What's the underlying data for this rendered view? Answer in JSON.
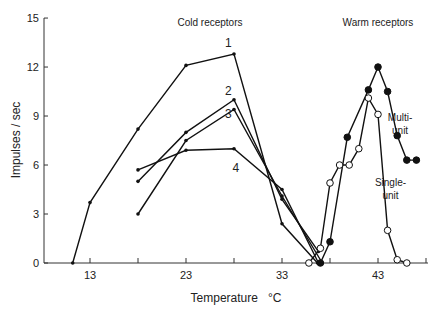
{
  "chart_data": {
    "type": "line",
    "title": "",
    "xlabel": "Temperature   °C",
    "ylabel": "Impulses / sec",
    "xlim": [
      5.5,
      49
    ],
    "ylim": [
      0,
      15
    ],
    "xticks": [
      13,
      18,
      23,
      28,
      33,
      38,
      43,
      48
    ],
    "xtick_labels": [
      "13",
      "",
      "23",
      "",
      "33",
      "",
      "43",
      ""
    ],
    "yticks": [
      0,
      3,
      6,
      9,
      12,
      15
    ],
    "ytick_labels": [
      "0",
      "3",
      "6",
      "9",
      "12",
      "15"
    ],
    "grid": false,
    "legend": "none (inline annotations)",
    "annotations": [
      {
        "text": "Cold  receptors",
        "x": 25.5,
        "y": 14.5
      },
      {
        "text": "Warm  receptors",
        "x": 43,
        "y": 14.5
      },
      {
        "text": "Multi-",
        "x": 45.3,
        "y": 8.7
      },
      {
        "text": "unit",
        "x": 45.3,
        "y": 7.9
      },
      {
        "text": "Single-",
        "x": 44.3,
        "y": 4.7
      },
      {
        "text": "unit",
        "x": 44.3,
        "y": 3.9
      }
    ],
    "series": [
      {
        "name": "1",
        "group": "Cold receptors",
        "marker": "small-dot",
        "label_pos": [
          27.4,
          13.2
        ],
        "x": [
          11.2,
          13,
          18,
          23,
          28,
          33,
          36.7
        ],
        "y": [
          0,
          3.7,
          8.2,
          12.1,
          12.8,
          2.4,
          0
        ]
      },
      {
        "name": "2",
        "group": "Cold receptors",
        "marker": "small-dot",
        "label_pos": [
          27.4,
          10.3
        ],
        "x": [
          18,
          23,
          28,
          33,
          36.8
        ],
        "y": [
          5.0,
          8.0,
          10.0,
          3.9,
          0.7
        ]
      },
      {
        "name": "3",
        "group": "Cold receptors",
        "marker": "small-dot",
        "label_pos": [
          27.4,
          8.9
        ],
        "x": [
          18,
          23,
          28,
          33,
          37.2
        ],
        "y": [
          3.0,
          7.5,
          9.4,
          4.1,
          0
        ]
      },
      {
        "name": "4",
        "group": "Cold receptors",
        "marker": "small-dot",
        "label_pos": [
          28.2,
          5.6
        ],
        "x": [
          18,
          23,
          28,
          33,
          36.8
        ],
        "y": [
          5.7,
          6.9,
          7.0,
          4.5,
          0
        ]
      },
      {
        "name": "Multi-unit",
        "group": "Warm receptors",
        "marker": "filled-circle",
        "x": [
          37,
          38,
          39.8,
          42,
          43,
          44,
          45,
          46,
          47
        ],
        "y": [
          0,
          1.3,
          7.7,
          10.6,
          12.0,
          10.5,
          7.8,
          6.3,
          6.3
        ]
      },
      {
        "name": "Single-unit",
        "group": "Warm receptors",
        "marker": "open-circle",
        "x": [
          35.8,
          37,
          38,
          39,
          40,
          41,
          42,
          43,
          44,
          45,
          46
        ],
        "y": [
          0,
          0.9,
          4.9,
          6.0,
          6.0,
          7.0,
          10.1,
          9.1,
          2.0,
          0.2,
          0
        ]
      }
    ]
  }
}
